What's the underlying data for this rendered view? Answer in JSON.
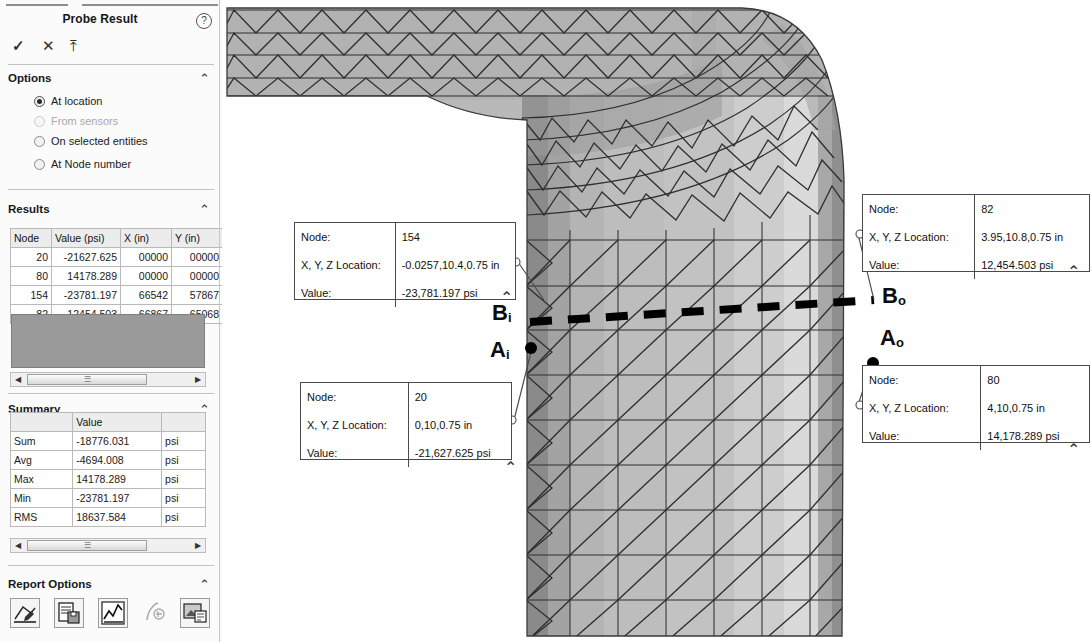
{
  "panel": {
    "title": "Probe Result",
    "help_icon": "help-icon",
    "actions": [
      {
        "name": "accept",
        "glyph": "✓"
      },
      {
        "name": "cancel",
        "glyph": "✕"
      },
      {
        "name": "pin",
        "glyph": "⤒"
      }
    ],
    "sections": {
      "options": {
        "title": "Options",
        "collapse_glyph": "⌃",
        "items": [
          {
            "label": "At location",
            "selected": true,
            "disabled": false
          },
          {
            "label": "From sensors",
            "selected": false,
            "disabled": true
          },
          {
            "label": "On selected entities",
            "selected": false,
            "disabled": false
          },
          {
            "label": "At Node number",
            "selected": false,
            "disabled": false
          }
        ]
      },
      "results": {
        "title": "Results",
        "collapse_glyph": "⌃",
        "columns": [
          "Node",
          "Value (psi)",
          "X (in)",
          "Y (in)"
        ],
        "rows": [
          [
            "20",
            "-21627.625",
            "00000",
            "00000"
          ],
          [
            "80",
            "14178.289",
            "00000",
            "00000"
          ],
          [
            "154",
            "-23781.197",
            "66542",
            "57867"
          ],
          [
            "82",
            "12454.503",
            "66867",
            "65068"
          ]
        ],
        "scroll_left_glyph": "◀",
        "scroll_right_glyph": "▶",
        "thumb_glyph": "☰"
      },
      "summary": {
        "title": "Summary",
        "collapse_glyph": "⌃",
        "columns": [
          "",
          "Value",
          ""
        ],
        "rows": [
          [
            "Sum",
            "-18776.031",
            "psi"
          ],
          [
            "Avg",
            "-4694.008",
            "psi"
          ],
          [
            "Max",
            "14178.289",
            "psi"
          ],
          [
            "Min",
            "-23781.197",
            "psi"
          ],
          [
            "RMS",
            "18637.584",
            "psi"
          ]
        ],
        "scroll_left_glyph": "◀",
        "scroll_right_glyph": "▶",
        "thumb_glyph": "☰"
      },
      "report_options": {
        "title": "Report Options",
        "collapse_glyph": "⌃",
        "icons": [
          "save-as-sensor-icon",
          "save-to-file-icon",
          "plot-graph-icon",
          "update-icon",
          "report-image-icon"
        ]
      }
    }
  },
  "viewport": {
    "callouts": [
      {
        "id": "node-154",
        "node_label": "Node:",
        "node_value": "154",
        "loc_label": "X, Y, Z Location:",
        "loc_value": "-0.0257,10.4,0.75 in",
        "val_label": "Value:",
        "val_value": "-23,781.197 psi"
      },
      {
        "id": "node-20",
        "node_label": "Node:",
        "node_value": "20",
        "loc_label": "X, Y, Z Location:",
        "loc_value": "0,10,0.75 in",
        "val_label": "Value:",
        "val_value": "-21,627.625 psi"
      },
      {
        "id": "node-82",
        "node_label": "Node:",
        "node_value": "82",
        "loc_label": "X, Y, Z Location:",
        "loc_value": "3.95,10.8,0.75 in",
        "val_label": "Value:",
        "val_value": "12,454.503  psi"
      },
      {
        "id": "node-80",
        "node_label": "Node:",
        "node_value": "80",
        "loc_label": "X, Y, Z Location:",
        "loc_value": "4,10,0.75 in",
        "val_label": "Value:",
        "val_value": "14,178.289  psi"
      }
    ],
    "point_labels": [
      {
        "id": "Bi",
        "base": "B",
        "sub": "i"
      },
      {
        "id": "Ai",
        "base": "A",
        "sub": "i"
      },
      {
        "id": "Bo",
        "base": "B",
        "sub": "o"
      },
      {
        "id": "Ao",
        "base": "A",
        "sub": "o"
      }
    ],
    "carets": [
      "⌃",
      "⌃",
      "⌃",
      "⌃"
    ]
  },
  "colors": {
    "panel_bg": "#fbfbfb",
    "mesh_line": "#2b2b2b",
    "fill_light": "#d8d8d8",
    "fill_mid": "#b4b4b4",
    "fill_dark": "#8e8e8e",
    "fill_darkest": "#6f6f6f",
    "callout_border": "#4a4a4a",
    "blank_rows": "#9a9a9a"
  }
}
